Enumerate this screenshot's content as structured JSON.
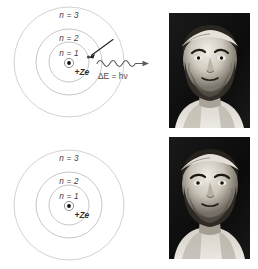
{
  "figure": {
    "background_color": "#ffffff"
  },
  "diagrams": [
    {
      "id": "atom-excited",
      "name": "bohr-atom-emission",
      "shell_labels": [
        "n = 3",
        "n = 2",
        "n = 1"
      ],
      "nucleus_label": "+Ze",
      "energy_label": "ΔE = hν",
      "has_electron_transition": true,
      "has_photon": true,
      "orbit_color": "#b9b9b9",
      "nucleus_color": "#111111"
    },
    {
      "id": "atom-ground",
      "name": "bohr-atom-ground-state",
      "shell_labels": [
        "n = 3",
        "n = 2",
        "n = 1"
      ],
      "nucleus_label": "+Ze",
      "energy_label": "",
      "has_electron_transition": false,
      "has_photon": false,
      "orbit_color": "#b9b9b9",
      "nucleus_color": "#111111"
    }
  ],
  "portraits": [
    {
      "id": "portrait-top",
      "name": "portrait-engraving-upper",
      "subject": "bearded classical philosopher with headband",
      "style": "black-and-white engraving",
      "frame_color": "#0e0e0e"
    },
    {
      "id": "portrait-bottom",
      "name": "portrait-engraving-lower",
      "subject": "bearded classical philosopher with headband",
      "style": "black-and-white engraving",
      "frame_color": "#0e0e0e"
    }
  ]
}
